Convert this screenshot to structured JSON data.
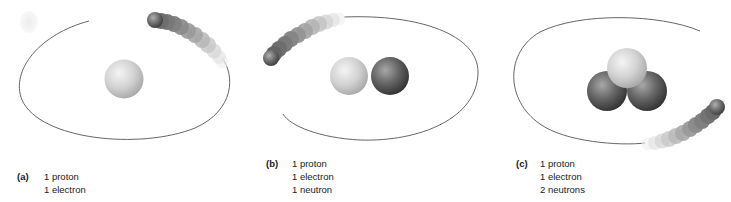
{
  "figure": {
    "colors": {
      "orbit": "#555555",
      "proton_light": "#d8d8d8",
      "proton_mid": "#b5b5b5",
      "neutron_dark": "#4a4a4a",
      "neutron_mid": "#7a7a7a",
      "electron": "#5a5a5a",
      "text": "#1a1a1a"
    },
    "panels": [
      {
        "label": "(a)",
        "lines": [
          "1 proton",
          "1 electron"
        ],
        "protons": 1,
        "electrons": 1,
        "neutrons": 0
      },
      {
        "label": "(b)",
        "lines": [
          "1 proton",
          "1 electron",
          "1 neutron"
        ],
        "protons": 1,
        "electrons": 1,
        "neutrons": 1
      },
      {
        "label": "(c)",
        "lines": [
          "1 proton",
          "1 electron",
          "2 neutrons"
        ],
        "protons": 1,
        "electrons": 1,
        "neutrons": 2
      }
    ]
  }
}
